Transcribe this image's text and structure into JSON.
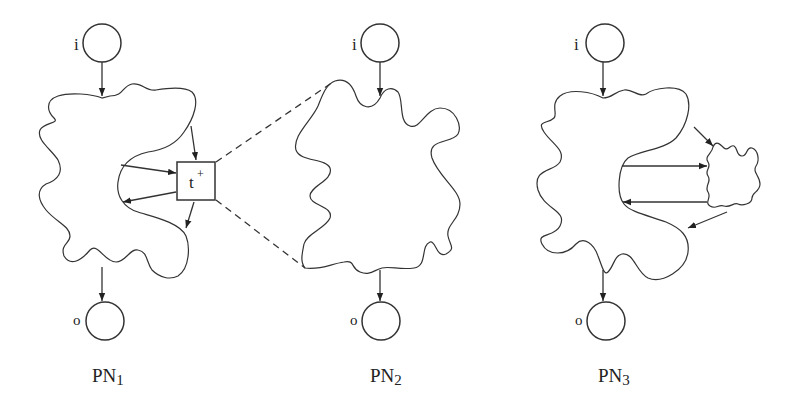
{
  "figure": {
    "panels": [
      {
        "id": "PN1",
        "label_main": "PN",
        "label_sub": "1",
        "input_place": "i",
        "output_place": "o",
        "transition": {
          "label": "t",
          "superscript": "+"
        }
      },
      {
        "id": "PN2",
        "label_main": "PN",
        "label_sub": "2",
        "input_place": "i",
        "output_place": "o"
      },
      {
        "id": "PN3",
        "label_main": "PN",
        "label_sub": "3",
        "input_place": "i",
        "output_place": "o"
      }
    ],
    "colors": {
      "stroke": "#333333",
      "background": "#ffffff"
    }
  }
}
